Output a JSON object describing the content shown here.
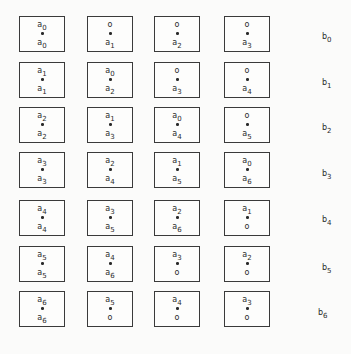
{
  "layout": {
    "col_x": [
      19,
      87,
      154,
      224
    ],
    "row_y": [
      16,
      62,
      107,
      152,
      200,
      246,
      291
    ],
    "b_label_pos": [
      [
        322,
        32
      ],
      [
        322,
        78
      ],
      [
        322,
        123
      ],
      [
        322,
        169
      ],
      [
        322,
        215
      ],
      [
        322,
        263
      ],
      [
        318,
        308
      ]
    ]
  },
  "rows": [
    {
      "b": {
        "base": "b",
        "sub": "0"
      },
      "cells": [
        {
          "top": {
            "base": "a",
            "sub": "0"
          },
          "bottom": {
            "base": "a",
            "sub": "0"
          }
        },
        {
          "top": {
            "base": "o",
            "sub": ""
          },
          "bottom": {
            "base": "a",
            "sub": "1"
          }
        },
        {
          "top": {
            "base": "o",
            "sub": ""
          },
          "bottom": {
            "base": "a",
            "sub": "2"
          }
        },
        {
          "top": {
            "base": "o",
            "sub": ""
          },
          "bottom": {
            "base": "a",
            "sub": "3"
          }
        }
      ]
    },
    {
      "b": {
        "base": "b",
        "sub": "1"
      },
      "cells": [
        {
          "top": {
            "base": "a",
            "sub": "1"
          },
          "bottom": {
            "base": "a",
            "sub": "1"
          }
        },
        {
          "top": {
            "base": "a",
            "sub": "0"
          },
          "bottom": {
            "base": "a",
            "sub": "2"
          }
        },
        {
          "top": {
            "base": "o",
            "sub": ""
          },
          "bottom": {
            "base": "a",
            "sub": "3"
          }
        },
        {
          "top": {
            "base": "o",
            "sub": ""
          },
          "bottom": {
            "base": "a",
            "sub": "4"
          }
        }
      ]
    },
    {
      "b": {
        "base": "b",
        "sub": "2"
      },
      "cells": [
        {
          "top": {
            "base": "a",
            "sub": "2"
          },
          "bottom": {
            "base": "a",
            "sub": "2"
          }
        },
        {
          "top": {
            "base": "a",
            "sub": "1"
          },
          "bottom": {
            "base": "a",
            "sub": "3"
          }
        },
        {
          "top": {
            "base": "a",
            "sub": "0"
          },
          "bottom": {
            "base": "a",
            "sub": "4"
          }
        },
        {
          "top": {
            "base": "o",
            "sub": ""
          },
          "bottom": {
            "base": "a",
            "sub": "5"
          }
        }
      ]
    },
    {
      "b": {
        "base": "b",
        "sub": "3"
      },
      "cells": [
        {
          "top": {
            "base": "a",
            "sub": "3"
          },
          "bottom": {
            "base": "a",
            "sub": "3"
          }
        },
        {
          "top": {
            "base": "a",
            "sub": "2"
          },
          "bottom": {
            "base": "a",
            "sub": "4"
          }
        },
        {
          "top": {
            "base": "a",
            "sub": "1"
          },
          "bottom": {
            "base": "a",
            "sub": "5"
          }
        },
        {
          "top": {
            "base": "a",
            "sub": "0"
          },
          "bottom": {
            "base": "a",
            "sub": "6"
          }
        }
      ]
    },
    {
      "b": {
        "base": "b",
        "sub": "4"
      },
      "cells": [
        {
          "top": {
            "base": "a",
            "sub": "4"
          },
          "bottom": {
            "base": "a",
            "sub": "4"
          }
        },
        {
          "top": {
            "base": "a",
            "sub": "3"
          },
          "bottom": {
            "base": "a",
            "sub": "5"
          }
        },
        {
          "top": {
            "base": "a",
            "sub": "2"
          },
          "bottom": {
            "base": "a",
            "sub": "6"
          }
        },
        {
          "top": {
            "base": "a",
            "sub": "1"
          },
          "bottom": {
            "base": "o",
            "sub": ""
          }
        }
      ]
    },
    {
      "b": {
        "base": "b",
        "sub": "5"
      },
      "cells": [
        {
          "top": {
            "base": "a",
            "sub": "5"
          },
          "bottom": {
            "base": "a",
            "sub": "5"
          }
        },
        {
          "top": {
            "base": "a",
            "sub": "4"
          },
          "bottom": {
            "base": "a",
            "sub": "6"
          }
        },
        {
          "top": {
            "base": "a",
            "sub": "3"
          },
          "bottom": {
            "base": "o",
            "sub": ""
          }
        },
        {
          "top": {
            "base": "a",
            "sub": "2"
          },
          "bottom": {
            "base": "o",
            "sub": ""
          }
        }
      ]
    },
    {
      "b": {
        "base": "b",
        "sub": "6"
      },
      "cells": [
        {
          "top": {
            "base": "a",
            "sub": "6"
          },
          "bottom": {
            "base": "a",
            "sub": "6"
          }
        },
        {
          "top": {
            "base": "a",
            "sub": "5"
          },
          "bottom": {
            "base": "o",
            "sub": ""
          }
        },
        {
          "top": {
            "base": "a",
            "sub": "4"
          },
          "bottom": {
            "base": "o",
            "sub": ""
          }
        },
        {
          "top": {
            "base": "a",
            "sub": "3"
          },
          "bottom": {
            "base": "o",
            "sub": ""
          }
        }
      ]
    }
  ]
}
